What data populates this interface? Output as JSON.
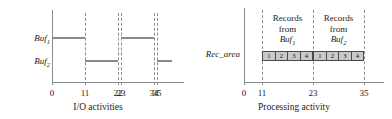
{
  "figure": {
    "panels": [
      {
        "id": "left",
        "xtitle": "I/O activities",
        "y_rows": [
          {
            "label": "Buf",
            "sub": "1"
          },
          {
            "label": "Buf",
            "sub": "2"
          }
        ],
        "x_ticks": [
          {
            "value": 0,
            "label": "0"
          },
          {
            "value": 11,
            "label": "11"
          },
          {
            "value": 22,
            "label": "22"
          },
          {
            "value": 23,
            "label": "23"
          },
          {
            "value": 34,
            "label": "34"
          },
          {
            "value": 35,
            "label": "35"
          }
        ],
        "gridlines": [
          11,
          22,
          23,
          34,
          35
        ],
        "xlim": [
          0,
          40
        ],
        "segments": [
          {
            "row": 0,
            "start": 0,
            "end": 11
          },
          {
            "row": 0,
            "start": 23,
            "end": 34
          },
          {
            "row": 1,
            "start": 11,
            "end": 22
          },
          {
            "row": 1,
            "start": 35,
            "end": 40
          }
        ]
      },
      {
        "id": "right",
        "xtitle": "Processing activity",
        "y_rows": [
          {
            "label": "Rec_area",
            "sub": ""
          }
        ],
        "x_ticks": [
          {
            "value": 0,
            "label": "0"
          },
          {
            "value": 11,
            "label": "11"
          },
          {
            "value": 23,
            "label": "23"
          },
          {
            "value": 35,
            "label": "35"
          }
        ],
        "gridlines": [
          11,
          23,
          35
        ],
        "xlim": [
          0,
          40
        ],
        "groups": [
          {
            "start": 11,
            "end": 23,
            "caption_line1": "Records",
            "caption_line2": "from",
            "caption_src": "Buf",
            "caption_sub": "1",
            "boxes": [
              "1",
              "2",
              "3",
              "4"
            ]
          },
          {
            "start": 23,
            "end": 35,
            "caption_line1": "Records",
            "caption_line2": "from",
            "caption_src": "Buf",
            "caption_sub": "2",
            "boxes": [
              "1",
              "2",
              "3",
              "4"
            ]
          }
        ]
      }
    ],
    "colors": {
      "axis": "#8a8a8a",
      "grid": "#8d8d8d",
      "bar": "#8a8a8a",
      "box_fill": "#c9c9c9",
      "box_border": "#4a4a4a",
      "text": "#1a1a1a"
    }
  }
}
